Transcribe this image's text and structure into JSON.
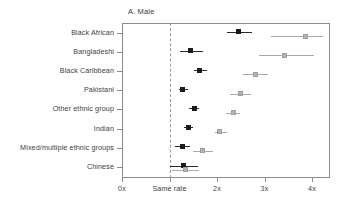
{
  "figure": {
    "panel_title": "A. Male"
  },
  "chart_data": {
    "type": "scatter",
    "title": "A. Male",
    "xlabel": "",
    "ylabel": "",
    "xlim": [
      0,
      4.4
    ],
    "grid": false,
    "legend_position": "none",
    "reference_line": {
      "value": 1,
      "label": "Same rate",
      "style": "dashed"
    },
    "xticks": [
      0,
      1,
      2,
      3,
      4
    ],
    "xticklabels": [
      "0x",
      "Same rate",
      "2x",
      "3x",
      "4x"
    ],
    "categories": [
      "Black African",
      "Bangladeshi",
      "Black Caribbean",
      "Pakistani",
      "Other ethnic group",
      "Indian",
      "Mixed/multiple ethnic groups",
      "Chinese"
    ],
    "series": [
      {
        "name": "Age adjusted",
        "color": "#1a1a1a",
        "values": [
          2.46,
          1.45,
          1.63,
          1.28,
          1.52,
          1.4,
          1.27,
          1.3
        ],
        "ci_low": [
          2.22,
          1.22,
          1.51,
          1.19,
          1.42,
          1.31,
          1.11,
          1.0
        ],
        "ci_high": [
          2.74,
          1.7,
          1.79,
          1.38,
          1.63,
          1.5,
          1.44,
          1.6
        ]
      },
      {
        "name": "Fully adjusted",
        "color": "#b4b4b4",
        "values": [
          3.86,
          3.42,
          2.82,
          2.49,
          2.34,
          2.06,
          1.69,
          1.33
        ],
        "ci_low": [
          3.13,
          2.88,
          2.55,
          2.27,
          2.18,
          1.95,
          1.5,
          1.05
        ],
        "ci_high": [
          4.23,
          4.04,
          3.08,
          2.72,
          2.48,
          2.22,
          1.91,
          1.62
        ]
      }
    ]
  }
}
